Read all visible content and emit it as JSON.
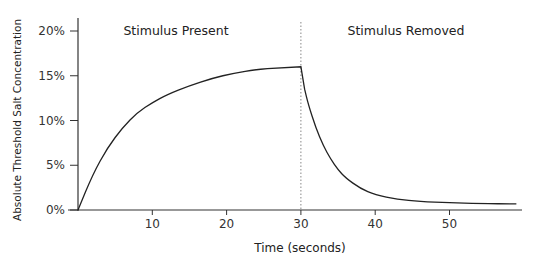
{
  "chart_data": {
    "type": "line",
    "title": "",
    "xlabel": "Time (seconds)",
    "ylabel": "Absolute Threshold Salt Concentration",
    "xlim": [
      0,
      60
    ],
    "ylim": [
      0,
      20
    ],
    "x_ticks": [
      10,
      20,
      30,
      40,
      50
    ],
    "x_tick_labels": [
      "10",
      "20",
      "30",
      "40",
      "50"
    ],
    "y_ticks": [
      0,
      5,
      10,
      15,
      20
    ],
    "y_tick_labels": [
      "0%",
      "5%",
      "10%",
      "15%",
      "20%"
    ],
    "grid": false,
    "legend": null,
    "series": [
      {
        "name": "Absolute threshold",
        "x": [
          0,
          2,
          4,
          6,
          8,
          10,
          12,
          15,
          18,
          21,
          24,
          27,
          30,
          30.5,
          31,
          32,
          33,
          34,
          35,
          36,
          38,
          40,
          43,
          46,
          50,
          54,
          59
        ],
        "y": [
          0,
          4.0,
          7.0,
          9.2,
          10.9,
          12.0,
          12.9,
          13.9,
          14.7,
          15.3,
          15.7,
          15.9,
          16.0,
          13.5,
          11.8,
          9.2,
          7.2,
          5.7,
          4.5,
          3.6,
          2.4,
          1.7,
          1.2,
          0.95,
          0.8,
          0.72,
          0.68
        ]
      }
    ],
    "annotations": [
      {
        "text": "Stimulus Present",
        "x": 15,
        "y": 20
      },
      {
        "text": "Stimulus Removed",
        "x": 45,
        "y": 20
      },
      {
        "type": "vline",
        "x": 30,
        "style": "dotted"
      }
    ]
  },
  "labels": {
    "present": "Stimulus Present",
    "removed": "Stimulus Removed",
    "xlabel": "Time (seconds)",
    "ylabel": "Absolute Threshold Salt Concentration"
  },
  "colors": {
    "line": "#222222",
    "axis": "#333333",
    "divider": "#888888"
  }
}
